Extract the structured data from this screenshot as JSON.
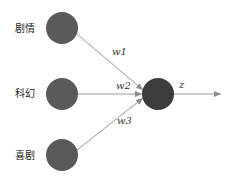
{
  "diagram": {
    "type": "perceptron",
    "inputs": [
      {
        "label": "剧情",
        "weight_label": "w1"
      },
      {
        "label": "科幻",
        "weight_label": "w2"
      },
      {
        "label": "喜剧",
        "weight_label": "w3"
      }
    ],
    "output": {
      "label": "z"
    },
    "colors": {
      "node_fill": "#5a5a5a",
      "output_node_fill": "#3c3c3c",
      "edge": "#9a9a9a",
      "text": "#222222"
    }
  }
}
